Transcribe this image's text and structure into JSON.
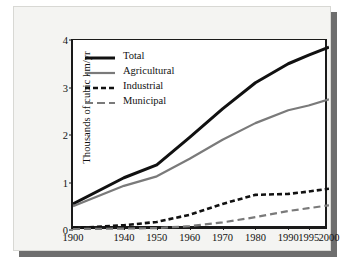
{
  "chart_data": {
    "type": "line",
    "title": "",
    "xlabel": "",
    "ylabel": "Thousands of cubic km/yr",
    "x": [
      1900,
      1940,
      1950,
      1960,
      1970,
      1980,
      1990,
      1995,
      2000
    ],
    "xticklabels": [
      "1900",
      "1940",
      "1950",
      "1960",
      "1970",
      "1980",
      "1990",
      "1995",
      "2000"
    ],
    "yticklabels": [
      "0",
      "1",
      "2",
      "3",
      "4"
    ],
    "yticks": [
      0,
      1,
      2,
      3,
      4
    ],
    "ylim": [
      0,
      4
    ],
    "xlim": [
      1900,
      2000
    ],
    "grid": false,
    "legend_position": "upper left",
    "series": [
      {
        "name": "Total",
        "color": "#111111",
        "style": "solid",
        "width": 3,
        "values": [
          0.55,
          1.1,
          1.37,
          1.95,
          2.55,
          3.1,
          3.5,
          3.68,
          3.85
        ]
      },
      {
        "name": "Agricultural",
        "color": "#7a7a7a",
        "style": "solid",
        "width": 2.2,
        "values": [
          0.5,
          0.93,
          1.13,
          1.5,
          1.9,
          2.25,
          2.52,
          2.62,
          2.75
        ]
      },
      {
        "name": "Industrial",
        "color": "#111111",
        "style": "dashed",
        "width": 2.6,
        "values": [
          0.04,
          0.1,
          0.17,
          0.32,
          0.55,
          0.74,
          0.76,
          0.81,
          0.87
        ]
      },
      {
        "name": "Municipal",
        "color": "#7a7a7a",
        "style": "dashed",
        "width": 2.2,
        "values": [
          0.02,
          0.03,
          0.04,
          0.08,
          0.16,
          0.27,
          0.4,
          0.46,
          0.52
        ]
      }
    ]
  },
  "legend": {
    "items": [
      {
        "label": "Total"
      },
      {
        "label": "Agricultural"
      },
      {
        "label": "Industrial"
      },
      {
        "label": "Municipal"
      }
    ]
  }
}
